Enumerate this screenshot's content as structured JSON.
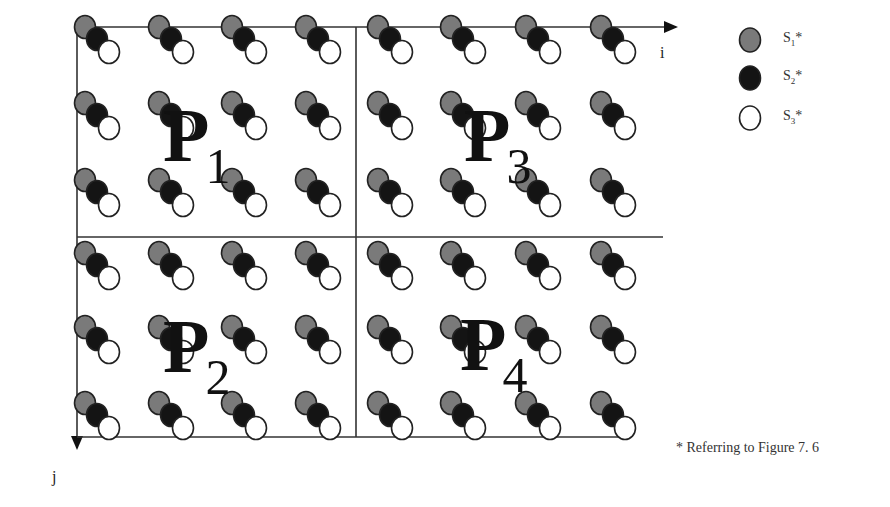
{
  "figure": {
    "axes": {
      "x_label": "i",
      "y_label": "j"
    },
    "partitions": [
      {
        "id": "P1",
        "letter": "P",
        "index": "1"
      },
      {
        "id": "P3",
        "letter": "P",
        "index": "3"
      },
      {
        "id": "P2",
        "letter": "P",
        "index": "2"
      },
      {
        "id": "P4",
        "letter": "P",
        "index": "4"
      }
    ],
    "grid": {
      "columns": 8,
      "rows": 6,
      "molecule_components": [
        "S1",
        "S2",
        "S3"
      ]
    },
    "legend": [
      {
        "symbol": "gray-filled-circle",
        "label": "S",
        "sub": "1",
        "suffix": "*",
        "color": "#7a7a7a"
      },
      {
        "symbol": "black-filled-circle",
        "label": "S",
        "sub": "2",
        "suffix": "*",
        "color": "#111111"
      },
      {
        "symbol": "white-open-circle",
        "label": "S",
        "sub": "3",
        "suffix": "*",
        "color": "#ffffff"
      }
    ],
    "footnote": "* Referring to Figure 7. 6"
  },
  "colors": {
    "s1": "#7a7a7a",
    "s2": "#141414",
    "s3": "#ffffff",
    "line": "#333333"
  }
}
